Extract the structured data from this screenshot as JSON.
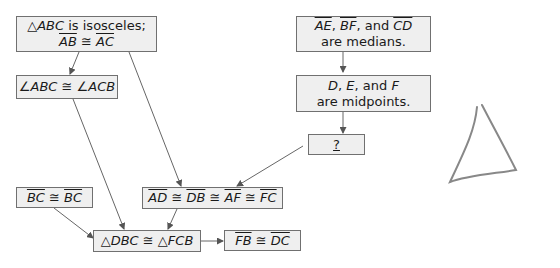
{
  "diagram": {
    "type": "flow-proof",
    "boxes": {
      "isosceles": {
        "line1_pre": "△",
        "line1_it": "ABC",
        "line1_post": " is isosceles;",
        "seg1": "AB",
        "cong": " ≅ ",
        "seg2": "AC"
      },
      "base_angles": {
        "a1": "∠",
        "a1_it": "ABC",
        "cong": " ≅ ",
        "a2": "∠",
        "a2_it": "ACB"
      },
      "medians": {
        "s1": "AE",
        "sep1": ", ",
        "s2": "BF",
        "sep2": ", and ",
        "s3": "CD",
        "line2": "are medians."
      },
      "midpoints": {
        "p1": "D",
        "sep1": ", ",
        "p2": "E",
        "sep2": ", and ",
        "p3": "F",
        "line2": "are midpoints."
      },
      "unknown": {
        "label": "?"
      },
      "reflexive": {
        "s1": "BC",
        "cong": " ≅ ",
        "s2": "BC"
      },
      "segments": {
        "s1": "AD",
        "c1": " ≅ ",
        "s2": "DB",
        "c2": " ≅ ",
        "s3": "AF",
        "c3": " ≅ ",
        "s4": "FC"
      },
      "triangles": {
        "t1": "△",
        "t1_it": "DBC",
        "cong": " ≅ ",
        "t2": "△",
        "t2_it": "FCB"
      },
      "conclusion": {
        "s1": "FB",
        "cong": " ≅ ",
        "s2": "DC"
      }
    },
    "edges": [
      [
        "isosceles",
        "base_angles"
      ],
      [
        "isosceles",
        "segments"
      ],
      [
        "medians",
        "midpoints"
      ],
      [
        "midpoints",
        "unknown"
      ],
      [
        "unknown",
        "segments"
      ],
      [
        "base_angles",
        "triangles"
      ],
      [
        "reflexive",
        "triangles"
      ],
      [
        "segments",
        "triangles"
      ],
      [
        "triangles",
        "conclusion"
      ]
    ],
    "sketch": "hand-drawn triangle"
  }
}
